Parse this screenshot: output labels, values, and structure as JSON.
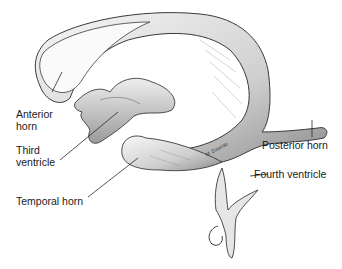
{
  "diagram": {
    "labels": {
      "anterior_horn": [
        "Anterior",
        "horn"
      ],
      "third_ventricle": [
        "Third",
        "ventricle"
      ],
      "temporal_horn": "Temporal horn",
      "posterior_horn": "Posterior horn",
      "fourth_ventricle": "Fourth ventricle"
    },
    "signature": "M. Dzierski",
    "colors": {
      "outline": "#3a3a3a",
      "shade": "#9a9a9a",
      "fill": "#f2f2f2",
      "text": "#1a1a1a"
    }
  }
}
